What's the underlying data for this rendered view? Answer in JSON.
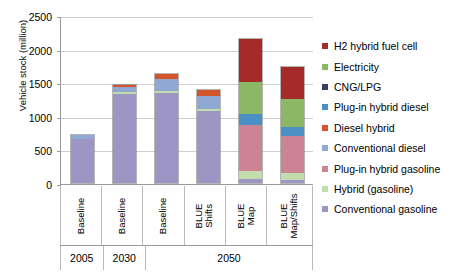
{
  "chart_data": {
    "type": "bar",
    "stacked": true,
    "title": "",
    "xlabel": "",
    "ylabel": "Vehicle stock (million)",
    "ylim": [
      0,
      2500
    ],
    "yticks": [
      0,
      500,
      1000,
      1500,
      2000,
      2500
    ],
    "grid": true,
    "legend_position": "right",
    "categories": [
      "Baseline",
      "Baseline",
      "Baseline",
      "BLUE\nShifts",
      "BLUE Map",
      "BLUE\nMap/Shifts"
    ],
    "period_groups": [
      {
        "label": "2005",
        "span": 1
      },
      {
        "label": "2030",
        "span": 1
      },
      {
        "label": "2050",
        "span": 4
      }
    ],
    "series": [
      {
        "name": "Conventional gasoline",
        "color": "#9d96c4",
        "values": [
          660,
          1330,
          1335,
          1070,
          65,
          50
        ]
      },
      {
        "name": "Hybrid (gasoline)",
        "color": "#c3dcab",
        "values": [
          0,
          20,
          30,
          30,
          115,
          105
        ]
      },
      {
        "name": "Plug-in hybrid gasoline",
        "color": "#cc8495",
        "values": [
          0,
          0,
          0,
          0,
          680,
          540
        ]
      },
      {
        "name": "Conventional diesel",
        "color": "#8fa8d4",
        "values": [
          50,
          75,
          190,
          190,
          0,
          0
        ]
      },
      {
        "name": "Hybrid (diesel)",
        "color": "#6aa8cf",
        "values": [
          0,
          0,
          0,
          0,
          0,
          0
        ]
      },
      {
        "name": "Diesel hybrid",
        "color": "#d4552a",
        "values": [
          0,
          40,
          60,
          100,
          0,
          0
        ]
      },
      {
        "name": "Plug-in hybrid diesel",
        "color": "#4a90c4",
        "values": [
          0,
          0,
          0,
          0,
          160,
          135
        ]
      },
      {
        "name": "CNG/LPG",
        "color": "#3c3c66",
        "values": [
          0,
          0,
          0,
          0,
          0,
          0
        ]
      },
      {
        "name": "Electricity",
        "color": "#8cb865",
        "values": [
          0,
          0,
          0,
          0,
          490,
          420
        ]
      },
      {
        "name": "H2 hybrid fuel cell",
        "color": "#a52a2a",
        "values": [
          0,
          0,
          0,
          0,
          630,
          470
        ]
      }
    ],
    "bar_totals": [
      710,
      1465,
      2135,
      1715,
      2140,
      1720
    ]
  },
  "legend": {
    "items": [
      {
        "label": "H2 hybrid fuel cell",
        "color": "#a52a2a"
      },
      {
        "label": "Electricity",
        "color": "#8cb865"
      },
      {
        "label": "CNG/LPG",
        "color": "#3c3c66"
      },
      {
        "label": "Plug-in hybrid diesel",
        "color": "#4a90c4"
      },
      {
        "label": "Diesel hybrid",
        "color": "#d4552a"
      },
      {
        "label": "Conventional diesel",
        "color": "#8fa8d4"
      },
      {
        "label": "Plug-in hybrid gasoline",
        "color": "#cc8495"
      },
      {
        "label": "Hybrid (gasoline)",
        "color": "#c3dcab"
      },
      {
        "label": "Conventional gasoline",
        "color": "#9d96c4"
      }
    ]
  }
}
